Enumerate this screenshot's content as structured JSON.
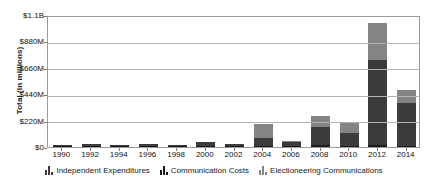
{
  "chart_data": {
    "type": "bar",
    "stacked": true,
    "title": "",
    "xlabel": "",
    "ylabel": "Total (in millions)",
    "ylim": [
      0,
      1100
    ],
    "yunit": "millions of USD",
    "grid": true,
    "legend_position": "bottom",
    "categories": [
      "1990",
      "1992",
      "1994",
      "1996",
      "1998",
      "2000",
      "2002",
      "2004",
      "2006",
      "2008",
      "2010",
      "2012",
      "2014"
    ],
    "ytick_labels": [
      "$1.1B",
      "$880M",
      "$660M",
      "$440M",
      "$220M",
      "$0"
    ],
    "ytick_values": [
      1100,
      880,
      660,
      440,
      220,
      0
    ],
    "series": [
      {
        "name": "Independent Expenditures",
        "color": "#3b3b3b",
        "values": [
          14,
          18,
          10,
          22,
          12,
          35,
          17,
          65,
          38,
          153,
          106,
          711,
          352
        ]
      },
      {
        "name": "Communication Costs",
        "color": "#1a1a1a",
        "values": [
          3,
          4,
          3,
          5,
          4,
          6,
          4,
          10,
          6,
          13,
          9,
          18,
          11
        ]
      },
      {
        "name": "Electioneering Communications",
        "color": "#848484",
        "values": [
          0,
          0,
          0,
          0,
          0,
          0,
          0,
          116,
          3,
          93,
          81,
          305,
          114
        ]
      }
    ],
    "totals": [
      17,
      22,
      13,
      27,
      16,
      41,
      21,
      191,
      47,
      259,
      196,
      1034,
      477
    ]
  },
  "legend": {
    "items": [
      {
        "label": "Independent Expenditures",
        "icon": "bar-swatch-icon"
      },
      {
        "label": "Communication Costs",
        "icon": "bar-swatch-icon"
      },
      {
        "label": "Electioneering Communications",
        "icon": "bar-swatch-icon"
      }
    ]
  }
}
